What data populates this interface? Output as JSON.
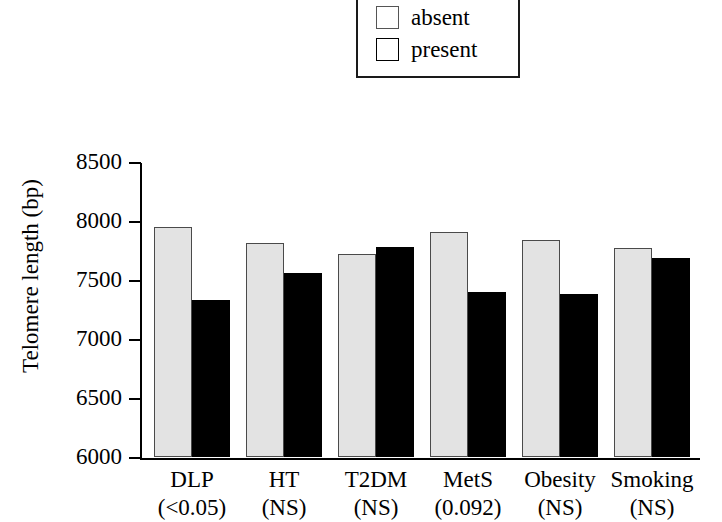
{
  "legend": {
    "items": [
      {
        "label": "absent",
        "icon": "square-swatch-icon",
        "color": "#e3e3e3"
      },
      {
        "label": "present",
        "icon": "square-swatch-icon",
        "color": "#000000"
      }
    ]
  },
  "axes": {
    "ylabel": "Telomere length (bp)",
    "yticks": [
      "8500",
      "8000",
      "7500",
      "7000",
      "6500",
      "6000"
    ]
  },
  "chart_data": {
    "type": "bar",
    "title": "",
    "xlabel": "",
    "ylabel": "Telomere length (bp)",
    "ylim": [
      6000,
      8500
    ],
    "ytick_values": [
      6000,
      6500,
      7000,
      7500,
      8000,
      8500
    ],
    "grid": false,
    "legend_position": "top-center",
    "categories": [
      "DLP",
      "HT",
      "T2DM",
      "MetS",
      "Obesity",
      "Smoking"
    ],
    "category_annotations": [
      "(<0.05)",
      "(NS)",
      "(NS)",
      "(0.092)",
      "(NS)",
      "(NS)"
    ],
    "series": [
      {
        "name": "absent",
        "color": "#e3e3e3",
        "values": [
          7950,
          7810,
          7720,
          7910,
          7840,
          7770
        ]
      },
      {
        "name": "present",
        "color": "#000000",
        "values": [
          7330,
          7560,
          7780,
          7400,
          7380,
          7690
        ]
      }
    ]
  }
}
